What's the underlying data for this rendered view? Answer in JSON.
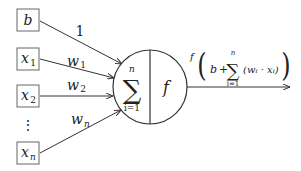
{
  "diagram": {
    "inputs": [
      {
        "id": "b",
        "label": "b",
        "sub": "",
        "weight": "1",
        "weight_sub": ""
      },
      {
        "id": "x1",
        "label": "x",
        "sub": "1",
        "weight": "w",
        "weight_sub": "1"
      },
      {
        "id": "x2",
        "label": "x",
        "sub": "2",
        "weight": "w",
        "weight_sub": "2"
      },
      {
        "id": "xn",
        "label": "x",
        "sub": "n",
        "weight": "w",
        "weight_sub": "n"
      }
    ],
    "ellipsis": "⋮",
    "neuron": {
      "sum_symbol": "∑",
      "sum_upper": "n",
      "sum_lower": "i=1",
      "activation": "f"
    },
    "output": {
      "f": "f",
      "open_paren": "(",
      "b": "b",
      "plus": "+",
      "sum_symbol": "∑",
      "sum_upper": "n",
      "sum_lower": "i=1",
      "term": "(wᵢ · xᵢ)",
      "close_paren": ")"
    },
    "colors": {
      "stroke": "#333333",
      "box_stroke": "#555555",
      "background": "#ffffff"
    }
  }
}
